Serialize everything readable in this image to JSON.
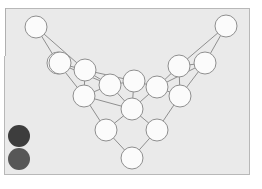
{
  "panel": {
    "background_color": "#eaeaea",
    "border_color": "#b8b8b8",
    "x": 4,
    "y": 8,
    "width": 246,
    "height": 167
  },
  "page_background_color": "#ffffff",
  "graph": {
    "node_fill_color": "#fbfbfb",
    "node_stroke_color": "#8f8f8f",
    "edge_stroke_color": "#8f8f8f",
    "node_radius": 11,
    "node_count": 16,
    "edge_count": 29,
    "nodes": [
      {
        "id": "n0",
        "cx": 36,
        "cy": 27,
        "r": 11
      },
      {
        "id": "n1",
        "cx": 226,
        "cy": 26,
        "r": 11
      },
      {
        "id": "n2",
        "cx": 58,
        "cy": 63,
        "r": 11
      },
      {
        "id": "n3",
        "cx": 85,
        "cy": 70,
        "r": 11
      },
      {
        "id": "n4",
        "cx": 179,
        "cy": 66,
        "r": 11
      },
      {
        "id": "n5",
        "cx": 205,
        "cy": 63,
        "r": 11
      },
      {
        "id": "n6",
        "cx": 110,
        "cy": 85,
        "r": 11
      },
      {
        "id": "n7",
        "cx": 134,
        "cy": 81,
        "r": 11
      },
      {
        "id": "n8",
        "cx": 157,
        "cy": 87,
        "r": 11
      },
      {
        "id": "n9",
        "cx": 84,
        "cy": 96,
        "r": 11
      },
      {
        "id": "n10",
        "cx": 180,
        "cy": 96,
        "r": 11
      },
      {
        "id": "n11",
        "cx": 132,
        "cy": 109,
        "r": 11
      },
      {
        "id": "n12",
        "cx": 106,
        "cy": 130,
        "r": 11
      },
      {
        "id": "n13",
        "cx": 157,
        "cy": 130,
        "r": 11
      },
      {
        "id": "n14",
        "cx": 132,
        "cy": 158,
        "r": 11
      },
      {
        "id": "n15",
        "cx": 60,
        "cy": 63,
        "r": 11
      }
    ],
    "edges": [
      {
        "from": "n0",
        "to": "n2"
      },
      {
        "from": "n0",
        "to": "n3"
      },
      {
        "from": "n1",
        "to": "n5"
      },
      {
        "from": "n1",
        "to": "n4"
      },
      {
        "from": "n2",
        "to": "n3"
      },
      {
        "from": "n2",
        "to": "n9"
      },
      {
        "from": "n2",
        "to": "n6"
      },
      {
        "from": "n3",
        "to": "n6"
      },
      {
        "from": "n3",
        "to": "n9"
      },
      {
        "from": "n3",
        "to": "n7"
      },
      {
        "from": "n4",
        "to": "n5"
      },
      {
        "from": "n4",
        "to": "n8"
      },
      {
        "from": "n4",
        "to": "n10"
      },
      {
        "from": "n5",
        "to": "n8"
      },
      {
        "from": "n5",
        "to": "n10"
      },
      {
        "from": "n6",
        "to": "n7"
      },
      {
        "from": "n6",
        "to": "n9"
      },
      {
        "from": "n6",
        "to": "n11"
      },
      {
        "from": "n7",
        "to": "n8"
      },
      {
        "from": "n7",
        "to": "n11"
      },
      {
        "from": "n8",
        "to": "n10"
      },
      {
        "from": "n8",
        "to": "n11"
      },
      {
        "from": "n9",
        "to": "n12"
      },
      {
        "from": "n9",
        "to": "n11"
      },
      {
        "from": "n10",
        "to": "n13"
      },
      {
        "from": "n11",
        "to": "n12"
      },
      {
        "from": "n11",
        "to": "n13"
      },
      {
        "from": "n12",
        "to": "n14"
      },
      {
        "from": "n13",
        "to": "n14"
      }
    ]
  },
  "tokens": [
    {
      "id": "token-1",
      "label": "dark-token",
      "cx": 19,
      "cy": 136,
      "r": 11,
      "color": "#3d3d3d"
    },
    {
      "id": "token-2",
      "label": "gray-token",
      "cx": 19,
      "cy": 159,
      "r": 11,
      "color": "#575757"
    }
  ]
}
